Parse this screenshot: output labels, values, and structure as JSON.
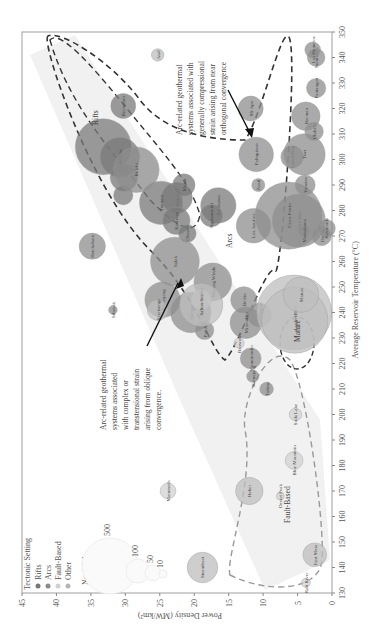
{
  "chart_data": {
    "type": "scatter",
    "title": "",
    "xlabel": "Average Reservoir Temperature (°C)",
    "ylabel": "Power Density (MW/km²)",
    "xlim": [
      130,
      350
    ],
    "ylim": [
      0,
      45
    ],
    "x_ticks": [
      130,
      140,
      150,
      160,
      170,
      180,
      190,
      200,
      210,
      220,
      230,
      240,
      250,
      260,
      270,
      280,
      290,
      300,
      310,
      320,
      330,
      340,
      350
    ],
    "y_ticks": [
      0,
      5,
      10,
      15,
      20,
      25,
      30,
      35,
      40,
      45
    ],
    "rotation": "figure rotated 90° counter-clockwise",
    "legend": {
      "title": "Tectonic Setting",
      "entries": [
        {
          "label": "Rifts",
          "color": "#777777"
        },
        {
          "label": "Arcs",
          "color": "#8a8a8a"
        },
        {
          "label": "Fault-Based",
          "color": "#d0d0d0"
        },
        {
          "label": "Other",
          "color": "#b5b5b5"
        }
      ],
      "size_title": "Net MW",
      "size_entries": [
        500,
        100,
        50,
        10
      ]
    },
    "region_labels": [
      "Rifts",
      "Arcs",
      "Fault-Based",
      "Mature"
    ],
    "annotations": [
      "Arc-related geothermal systems associated with generally compressional strain arising from near orthogonal convergence",
      "Arc-related geothermal systems associated with complex or transtensional strain arising from oblique convergence."
    ],
    "series": [
      {
        "name": "Rifts",
        "color": "#7a7a7a",
        "points": [
          {
            "label": "Reykjanes",
            "x": 321,
            "y": 30.3,
            "mw": 100
          },
          {
            "label": "",
            "x": 305,
            "y": 33.2,
            "mw": 500
          },
          {
            "label": "Hell.Sn",
            "x": 301,
            "y": 30.8,
            "mw": 250
          },
          {
            "label": "",
            "x": 293,
            "y": 30.2,
            "mw": 120
          },
          {
            "label": "",
            "x": 286,
            "y": 30.3,
            "mw": 60
          },
          {
            "label": "Wairakei",
            "x": 285,
            "y": 22.5,
            "mw": 150
          },
          {
            "label": "Tauhara",
            "x": 283,
            "y": 24.8,
            "mw": 300
          },
          {
            "label": "Mokai",
            "x": 290,
            "y": 21.5,
            "mw": 80
          },
          {
            "label": "Kawerau",
            "x": 276,
            "y": 22.6,
            "mw": 120
          },
          {
            "label": "Ohaaki",
            "x": 271,
            "y": 21.0,
            "mw": 50
          },
          {
            "label": "Rotokawa",
            "x": 282,
            "y": 16.5,
            "mw": 200
          },
          {
            "label": "Ngatamariki",
            "x": 278,
            "y": 17.5,
            "mw": 80
          }
        ]
      },
      {
        "name": "Arcs",
        "color": "#8e8e8e",
        "points": [
          {
            "label": "Bulalo",
            "x": 296,
            "y": 28.4,
            "mw": 330
          },
          {
            "label": "Hatchobaru",
            "x": 266,
            "y": 34.8,
            "mw": 110
          },
          {
            "label": "Salak",
            "x": 260,
            "y": 22.8,
            "mw": 380
          },
          {
            "label": "Wayang Windu",
            "x": 252,
            "y": 17.3,
            "mw": 227
          },
          {
            "label": "Kamojang",
            "x": 245,
            "y": 24.6,
            "mw": 200
          },
          {
            "label": "Darajat",
            "x": 240,
            "y": 20.5,
            "mw": 260
          },
          {
            "label": "Sibayak",
            "x": 241,
            "y": 31.8,
            "mw": 12
          },
          {
            "label": "Patuha",
            "x": 233,
            "y": 18.5,
            "mw": 55
          },
          {
            "label": "Los Azufres",
            "x": 274,
            "y": 11.4,
            "mw": 190
          },
          {
            "label": "Palinpinon",
            "x": 302,
            "y": 11.0,
            "mw": 190
          },
          {
            "label": "Lahendong",
            "x": 301,
            "y": 5.8,
            "mw": 80
          },
          {
            "label": "Tiwi",
            "x": 302,
            "y": 4.0,
            "mw": 275
          },
          {
            "label": "Momotombo",
            "x": 222,
            "y": 11.8,
            "mw": 70
          },
          {
            "label": "Berlin",
            "x": 245,
            "y": 12.8,
            "mw": 110
          },
          {
            "label": "Ahuachapan",
            "x": 239,
            "y": 10.5,
            "mw": 90
          },
          {
            "label": "Miravalles",
            "x": 236,
            "y": 12.5,
            "mw": 160
          },
          {
            "label": "Zunil",
            "x": 290,
            "y": 10.7,
            "mw": 28
          },
          {
            "label": "Mak-Ban",
            "x": 276,
            "y": 4.8,
            "mw": 450
          },
          {
            "label": "Cerro Prieto",
            "x": 278,
            "y": 6.3,
            "mw": 720
          },
          {
            "label": "Matsukawa",
            "x": 272,
            "y": 4.1,
            "mw": 23
          },
          {
            "label": "Yanaizu",
            "x": 290,
            "y": 3.9,
            "mw": 65
          },
          {
            "label": "Ulubelu",
            "x": 311,
            "y": 2.6,
            "mw": 55
          },
          {
            "label": "Bacman",
            "x": 317,
            "y": 3.8,
            "mw": 130
          },
          {
            "label": "Dieng",
            "x": 270,
            "y": 1.5,
            "mw": 60
          },
          {
            "label": "Kakkonda",
            "x": 273,
            "y": 0.8,
            "mw": 50
          },
          {
            "label": "Sumikawa",
            "x": 340,
            "y": 2.3,
            "mw": 50
          },
          {
            "label": "Los Humeros",
            "x": 343,
            "y": 2.8,
            "mw": 40
          },
          {
            "label": "Pantangan",
            "x": 328,
            "y": 2.3,
            "mw": 60
          },
          {
            "label": "Mt Apo",
            "x": 320,
            "y": 11.8,
            "mw": 100
          },
          {
            "label": "Kamojang",
            "x": 215,
            "y": 11.5,
            "mw": 24
          },
          {
            "label": "Tolima",
            "x": 210,
            "y": 9.5,
            "mw": 30
          }
        ]
      },
      {
        "name": "Fault-Based",
        "color": "#d2d2d2",
        "points": [
          {
            "label": "Dixie Valley",
            "x": 245,
            "y": 19.0,
            "mw": 67
          },
          {
            "label": "Beowawe",
            "x": 228,
            "y": 13.5,
            "mw": 17
          },
          {
            "label": "Desert Peak",
            "x": 168,
            "y": 7.5,
            "mw": 10
          },
          {
            "label": "Blue Mountain",
            "x": 182,
            "y": 5.5,
            "mw": 50
          },
          {
            "label": "Raft River",
            "x": 134,
            "y": 3.8,
            "mw": 13
          },
          {
            "label": "Mammoth",
            "x": 170,
            "y": 23.8,
            "mw": 40
          },
          {
            "label": "Soda Lake",
            "x": 200,
            "y": 5.3,
            "mw": 25
          }
        ]
      },
      {
        "name": "Other",
        "color": "#bdbdbd",
        "points": [
          {
            "label": "Steamboat",
            "x": 140,
            "y": 18.8,
            "mw": 150
          },
          {
            "label": "Salton Sea",
            "x": 243,
            "y": 19.0,
            "mw": 300
          },
          {
            "label": "Heber",
            "x": 170,
            "y": 12.0,
            "mw": 120
          },
          {
            "label": "East Mesa",
            "x": 145,
            "y": 2.5,
            "mw": 90
          },
          {
            "label": "Geysers",
            "x": 240,
            "y": 5.5,
            "mw": 900
          },
          {
            "label": "Larderello",
            "x": 237,
            "y": 5.4,
            "mw": 700
          },
          {
            "label": "Mature",
            "x": 247,
            "y": 4.5,
            "mw": 200
          },
          {
            "label": "Asal",
            "x": 341,
            "y": 25.3,
            "mw": 25
          },
          {
            "label": "Svartsengi",
            "x": 241,
            "y": 25.3,
            "mw": 70
          }
        ]
      }
    ]
  },
  "axis": {
    "x_title": "Average Reservoir Temperature (°C)",
    "y_title": "Power Density (MW/km²)"
  },
  "legend": {
    "title": "Tectonic Setting",
    "items": [
      "Rifts",
      "Arcs",
      "Fault-Based",
      "Other"
    ],
    "size_title": "Net MW",
    "sizes": [
      "500",
      "100",
      "50",
      "10"
    ]
  },
  "labels": {
    "rifts": "Rifts",
    "arcs": "Arcs",
    "fault": "Fault-Based",
    "mature": "Mature"
  },
  "annotations": {
    "top": [
      "Arc-related geothermal",
      "systems associated with",
      "generally compressional",
      "strain arising from near",
      "orthogonal convergence"
    ],
    "bottom": [
      "Arc-related geothermal",
      "systems associated",
      "with complex or",
      "transtensional strain",
      "arising from oblique",
      "convergence."
    ]
  }
}
